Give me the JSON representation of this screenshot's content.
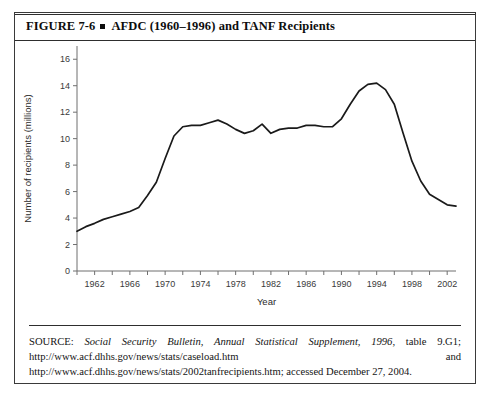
{
  "figure": {
    "label": "FIGURE 7-6",
    "bullet_icon": "square-bullet-icon",
    "title": "AFDC (1960–1996) and TANF Recipients"
  },
  "source": {
    "label": "SOURCE:",
    "italic_part": "Social Security Bulletin, Annual Statistical Supplement, 1996",
    "rest_1": ", table 9.G1; http://www.acf.dhhs.gov/news/stats/caseload.htm",
    "conjunction": "and",
    "rest_2": "http://www.acf.dhhs.gov/news/stats/2002tanfrecipients.htm; accessed December 27, 2004."
  },
  "chart_data": {
    "type": "line",
    "title": "AFDC (1960–1996) and TANF Recipients",
    "xlabel": "Year",
    "ylabel": "Number of recipients (millions)",
    "xlim": [
      1960,
      2003
    ],
    "ylim": [
      0,
      17
    ],
    "grid": false,
    "legend": "none",
    "y_ticks": [
      0,
      2,
      4,
      6,
      8,
      10,
      12,
      14,
      16
    ],
    "y_tick_labels": [
      "0",
      "2",
      "4",
      "6",
      "8",
      "10",
      "12",
      "14",
      "16"
    ],
    "x_ticks": [
      1962,
      1966,
      1970,
      1974,
      1978,
      1982,
      1986,
      1990,
      1994,
      1998,
      2002
    ],
    "x_tick_labels": [
      "1962",
      "1966",
      "1970",
      "1974",
      "1978",
      "1982",
      "1986",
      "1990",
      "1994",
      "1998",
      "2002"
    ],
    "x_minor_tick_step": 2,
    "line_color": "#1a1a1a",
    "series": [
      {
        "name": "Number of recipients (millions)",
        "x": [
          1960,
          1961,
          1962,
          1963,
          1964,
          1965,
          1966,
          1967,
          1968,
          1969,
          1970,
          1971,
          1972,
          1973,
          1974,
          1975,
          1976,
          1977,
          1978,
          1979,
          1980,
          1981,
          1982,
          1983,
          1984,
          1985,
          1986,
          1987,
          1988,
          1989,
          1990,
          1991,
          1992,
          1993,
          1994,
          1995,
          1996,
          1997,
          1998,
          1999,
          2000,
          2001,
          2002,
          2003
        ],
        "values": [
          3.0,
          3.35,
          3.6,
          3.9,
          4.1,
          4.3,
          4.5,
          4.8,
          5.7,
          6.7,
          8.5,
          10.2,
          10.9,
          11.0,
          11.0,
          11.2,
          11.4,
          11.1,
          10.7,
          10.4,
          10.6,
          11.1,
          10.4,
          10.7,
          10.8,
          10.8,
          11.0,
          11.0,
          10.9,
          10.9,
          11.5,
          12.6,
          13.6,
          14.1,
          14.2,
          13.7,
          12.6,
          10.4,
          8.3,
          6.8,
          5.8,
          5.4,
          5.0,
          4.9
        ]
      }
    ]
  }
}
